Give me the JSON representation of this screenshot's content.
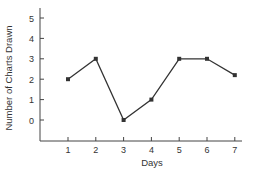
{
  "chart_data": {
    "type": "line",
    "title": "",
    "xlabel": "Days",
    "ylabel": "Number of Charts Drawn",
    "x": [
      1,
      2,
      3,
      4,
      5,
      6,
      7
    ],
    "categories": [
      "1",
      "2",
      "3",
      "4",
      "5",
      "6",
      "7"
    ],
    "series": [
      {
        "name": "Charts Drawn",
        "values": [
          2,
          3,
          0,
          1,
          3,
          3,
          2.2
        ]
      }
    ],
    "values": [
      2,
      3,
      0,
      1,
      3,
      3,
      2.2
    ],
    "xticks": [
      "1",
      "2",
      "3",
      "4",
      "5",
      "6",
      "7"
    ],
    "yticks": [
      "0",
      "1",
      "2",
      "3",
      "4",
      "5"
    ],
    "ylim": [
      -1,
      5.5
    ],
    "xlim": [
      0,
      7.3
    ],
    "grid": false,
    "legend": null,
    "colors": {
      "line": "#333333",
      "axis": "#444444",
      "text": "#333333"
    }
  }
}
